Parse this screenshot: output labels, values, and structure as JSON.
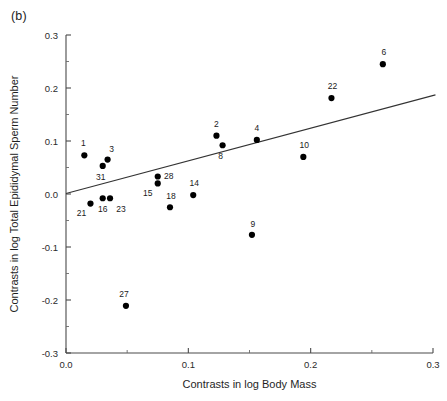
{
  "panel": {
    "label": "(b)"
  },
  "chart_data": {
    "type": "scatter",
    "title": "",
    "xlabel": "Contrasts in log Body Mass",
    "ylabel": "Contrasts in log Total Epididymal Sperm Number",
    "xlim": [
      0.0,
      0.3
    ],
    "ylim": [
      -0.3,
      0.3
    ],
    "grid": false,
    "legend": null,
    "xticks": [
      0.0,
      0.1,
      0.2,
      0.3
    ],
    "xticklabels": [
      "0.0",
      "0.1",
      "0.2",
      "0.3"
    ],
    "xminorticks": [
      0.05,
      0.15,
      0.25
    ],
    "yticks": [
      -0.3,
      -0.2,
      -0.1,
      0.0,
      0.1,
      0.2,
      0.3
    ],
    "yticklabels": [
      "-0.3",
      "-0.2",
      "-0.1",
      "0.0",
      "0.1",
      "0.2",
      "0.3"
    ],
    "yminorticks": [
      -0.25,
      -0.15,
      -0.05,
      0.05,
      0.15,
      0.25
    ],
    "points": [
      {
        "label": "1",
        "x": 0.015,
        "y": 0.073,
        "lx": -1,
        "ly": -9
      },
      {
        "label": "3",
        "x": 0.034,
        "y": 0.065,
        "lx": 4,
        "ly": -8
      },
      {
        "label": "31",
        "x": 0.03,
        "y": 0.053,
        "lx": -2,
        "ly": 14
      },
      {
        "label": "21",
        "x": 0.02,
        "y": -0.018,
        "lx": -9,
        "ly": 12
      },
      {
        "label": "16",
        "x": 0.03,
        "y": -0.008,
        "lx": 0,
        "ly": 14
      },
      {
        "label": "23",
        "x": 0.036,
        "y": -0.008,
        "lx": 11,
        "ly": 14
      },
      {
        "label": "27",
        "x": 0.049,
        "y": -0.211,
        "lx": -2,
        "ly": -9
      },
      {
        "label": "28",
        "x": 0.075,
        "y": 0.033,
        "lx": 11,
        "ly": 2
      },
      {
        "label": "15",
        "x": 0.075,
        "y": 0.02,
        "lx": -10,
        "ly": 13
      },
      {
        "label": "18",
        "x": 0.085,
        "y": -0.025,
        "lx": 1,
        "ly": -8
      },
      {
        "label": "14",
        "x": 0.104,
        "y": -0.002,
        "lx": 1,
        "ly": -9
      },
      {
        "label": "2",
        "x": 0.123,
        "y": 0.11,
        "lx": 0,
        "ly": -9
      },
      {
        "label": "8",
        "x": 0.128,
        "y": 0.092,
        "lx": -2,
        "ly": 14
      },
      {
        "label": "4",
        "x": 0.156,
        "y": 0.102,
        "lx": 0,
        "ly": -9
      },
      {
        "label": "9",
        "x": 0.152,
        "y": -0.077,
        "lx": 1,
        "ly": -8
      },
      {
        "label": "10",
        "x": 0.194,
        "y": 0.07,
        "lx": 1,
        "ly": -9
      },
      {
        "label": "22",
        "x": 0.217,
        "y": 0.181,
        "lx": 1,
        "ly": -9
      },
      {
        "label": "6",
        "x": 0.259,
        "y": 0.245,
        "lx": 1,
        "ly": -9
      }
    ],
    "trendline": {
      "x0": 0.0,
      "y0": 0.001,
      "x1": 0.302,
      "y1": 0.187
    }
  },
  "colors": {
    "marker": "#000000",
    "axis": "#4a4a4a",
    "trend": "#333333",
    "background": "#ffffff"
  }
}
